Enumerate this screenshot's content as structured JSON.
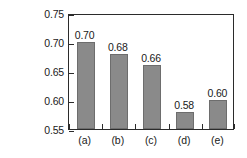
{
  "chart_data": {
    "type": "bar",
    "title": "",
    "xlabel": "",
    "ylabel": "Total surface deflection",
    "ylabel_line1": "Total surface deflection",
    "ylabel_line2_main": "Δ",
    "ylabel_line2_sub": "T",
    "ylabel_line2_units": " (mm)",
    "categories": [
      "(a)",
      "(b)",
      "(c)",
      "(d)",
      "(e)"
    ],
    "values": [
      0.7,
      0.68,
      0.66,
      0.58,
      0.6
    ],
    "value_labels": [
      "0.70",
      "0.68",
      "0.66",
      "0.58",
      "0.60"
    ],
    "ylim": [
      0.55,
      0.75
    ],
    "yticks": [
      0.55,
      0.6,
      0.65,
      0.7,
      0.75
    ],
    "ytick_labels": [
      "0.55",
      "0.60",
      "0.65",
      "0.70",
      "0.75"
    ],
    "grid": false,
    "legend": null,
    "bar_color": "#8a8a8a",
    "bar_edge_color": "#6d6d6d",
    "axis_color": "#2b2b2b",
    "background_color": "#ffffff"
  }
}
